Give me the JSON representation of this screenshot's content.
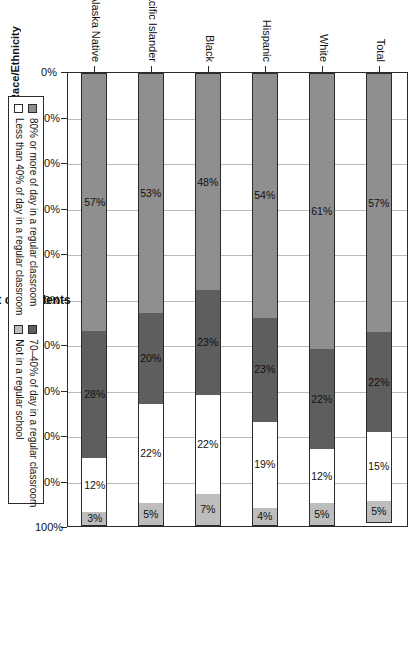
{
  "chart_data": {
    "type": "bar",
    "orientation": "horizontal-stacked",
    "title": "",
    "xlabel": "Percent of Students",
    "ylabel": "Race/Ethnicity",
    "xlim": [
      0,
      100
    ],
    "grid": true,
    "legend_position": "bottom",
    "x_tick_labels": [
      "0%",
      "10%",
      "20%",
      "30%",
      "40%",
      "50%",
      "60%",
      "70%",
      "80%",
      "90%",
      "100%"
    ],
    "x_tick_values": [
      0,
      10,
      20,
      30,
      40,
      50,
      60,
      70,
      80,
      90,
      100
    ],
    "categories": [
      "Total",
      "White",
      "Hispanic",
      "Black",
      "Asian/Pacific Islander",
      "American Indian/Alaska Native"
    ],
    "series": [
      {
        "name": "80% or more of day in a regular classroom",
        "color": "#8f8f8f",
        "values": [
          57,
          61,
          54,
          48,
          53,
          57
        ],
        "labels": [
          "57%",
          "61%",
          "54%",
          "48%",
          "53%",
          "57%"
        ]
      },
      {
        "name": "70–40% of day in a regular classroom",
        "color": "#5e5e5e",
        "values": [
          22,
          22,
          23,
          23,
          20,
          28
        ],
        "labels": [
          "22%",
          "22%",
          "23%",
          "23%",
          "20%",
          "28%"
        ]
      },
      {
        "name": "Less than 40% of day in a regular classroom",
        "color": "#ffffff",
        "values": [
          15,
          12,
          19,
          22,
          22,
          12
        ],
        "labels": [
          "15%",
          "12%",
          "19%",
          "22%",
          "22%",
          "12%"
        ]
      },
      {
        "name": "Not in a regular school",
        "color": "#bdbdbd",
        "values": [
          5,
          5,
          4,
          7,
          5,
          3
        ],
        "labels": [
          "5%",
          "5%",
          "4%",
          "7%",
          "5%",
          "3%"
        ]
      }
    ]
  },
  "legend": {
    "entries": [
      {
        "label": "80% or more of day in a regular classroom",
        "color": "#8f8f8f"
      },
      {
        "label": "70–40% of day in a regular classroom",
        "color": "#5e5e5e"
      },
      {
        "label": "Less than 40% of day in a regular classroom",
        "color": "#ffffff"
      },
      {
        "label": "Not in a regular school",
        "color": "#bdbdbd"
      }
    ]
  },
  "axes": {
    "x_title": "Percent of Students",
    "y_title": "Race/Ethnicity"
  }
}
